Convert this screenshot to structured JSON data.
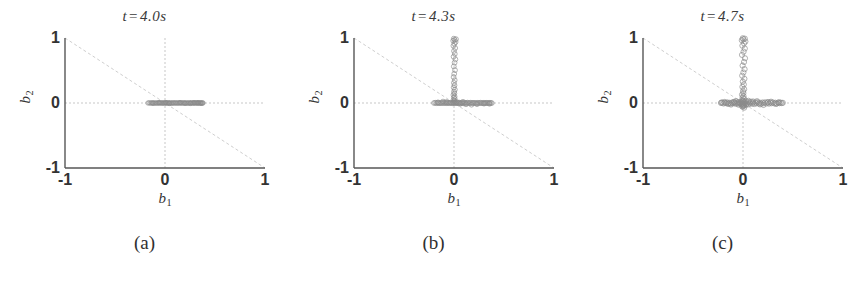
{
  "figure": {
    "background": "#ffffff",
    "axis_color": "#555555",
    "grid_color": "#aaaaaa",
    "diagonal_color": "#bbbbbb",
    "point_color": "#8a8a8a"
  },
  "panels": [
    {
      "key": "a",
      "title_var": "t",
      "title_eq": "=",
      "title_value": "4.0s",
      "title": "t = 4.0s",
      "subcaption": "(a)",
      "xlabel": "b",
      "xlabel_sub": "1",
      "ylabel": "b",
      "ylabel_sub": "2",
      "xticks": [
        "-1",
        "0",
        "1"
      ],
      "yticks": [
        "1",
        "0",
        "-1"
      ]
    },
    {
      "key": "b",
      "title_var": "t",
      "title_eq": "=",
      "title_value": "4.3s",
      "title": "t = 4.3s",
      "subcaption": "(b)",
      "xlabel": "b",
      "xlabel_sub": "1",
      "ylabel": "b",
      "ylabel_sub": "2",
      "xticks": [
        "-1",
        "0",
        "1"
      ],
      "yticks": [
        "1",
        "0",
        "-1"
      ]
    },
    {
      "key": "c",
      "title_var": "t",
      "title_eq": "=",
      "title_value": "4.7s",
      "title": "t = 4.7s",
      "subcaption": "(c)",
      "xlabel": "b",
      "xlabel_sub": "1",
      "ylabel": "b",
      "ylabel_sub": "2",
      "xticks": [
        "-1",
        "0",
        "1"
      ],
      "yticks": [
        "1",
        "0",
        "-1"
      ]
    }
  ],
  "chart_data": [
    {
      "type": "scatter",
      "title": "t = 4.0s",
      "subcaption": "(a)",
      "xlabel": "b_1",
      "ylabel": "b_2",
      "xlim": [
        -1,
        1
      ],
      "ylim": [
        -1,
        1
      ],
      "xticks": [
        -1,
        0,
        1
      ],
      "yticks": [
        -1,
        0,
        1
      ],
      "grid": "dashed crosshair at x=0 and y=0",
      "annotations": [
        {
          "type": "line",
          "name": "anti-diagonal",
          "from": [
            -1,
            1
          ],
          "to": [
            1,
            -1
          ],
          "style": "dashed",
          "color": "#bbbbbb"
        }
      ],
      "marker": "open circle",
      "marker_size": 2.2,
      "description": "Points collapse to a thin horizontal band on b_2 = 0, spanning roughly b_1 from -0.17 to 0.38.",
      "points": [
        [
          -0.17,
          0.0
        ],
        [
          -0.158,
          0.003
        ],
        [
          -0.146,
          -0.002
        ],
        [
          -0.135,
          0.001
        ],
        [
          -0.124,
          0.004
        ],
        [
          -0.113,
          -0.003
        ],
        [
          -0.102,
          0.002
        ],
        [
          -0.092,
          0.0
        ],
        [
          -0.082,
          -0.004
        ],
        [
          -0.072,
          0.003
        ],
        [
          -0.063,
          0.001
        ],
        [
          -0.054,
          -0.002
        ],
        [
          -0.045,
          0.004
        ],
        [
          -0.036,
          0.0
        ],
        [
          -0.028,
          -0.003
        ],
        [
          -0.02,
          0.002
        ],
        [
          -0.012,
          0.001
        ],
        [
          -0.005,
          -0.001
        ],
        [
          0.003,
          0.003
        ],
        [
          0.011,
          0.0
        ],
        [
          0.019,
          -0.002
        ],
        [
          0.027,
          0.004
        ],
        [
          0.035,
          0.001
        ],
        [
          0.043,
          -0.003
        ],
        [
          0.051,
          0.002
        ],
        [
          0.06,
          0.0
        ],
        [
          0.068,
          -0.004
        ],
        [
          0.077,
          0.003
        ],
        [
          0.085,
          0.001
        ],
        [
          0.094,
          -0.002
        ],
        [
          0.103,
          0.004
        ],
        [
          0.112,
          0.0
        ],
        [
          0.121,
          -0.003
        ],
        [
          0.13,
          0.002
        ],
        [
          0.139,
          0.001
        ],
        [
          0.148,
          -0.001
        ],
        [
          0.157,
          0.003
        ],
        [
          0.166,
          0.0
        ],
        [
          0.175,
          -0.002
        ],
        [
          0.184,
          0.004
        ],
        [
          0.193,
          0.001
        ],
        [
          0.202,
          -0.003
        ],
        [
          0.211,
          0.002
        ],
        [
          0.22,
          0.0
        ],
        [
          0.229,
          -0.004
        ],
        [
          0.238,
          0.003
        ],
        [
          0.247,
          0.001
        ],
        [
          0.256,
          -0.002
        ],
        [
          0.265,
          0.004
        ],
        [
          0.274,
          0.0
        ],
        [
          0.282,
          -0.003
        ],
        [
          0.29,
          0.002
        ],
        [
          0.298,
          0.001
        ],
        [
          0.306,
          -0.001
        ],
        [
          0.313,
          0.003
        ],
        [
          0.32,
          0.0
        ],
        [
          0.327,
          -0.002
        ],
        [
          0.334,
          0.002
        ],
        [
          0.341,
          0.001
        ],
        [
          0.348,
          -0.001
        ],
        [
          0.355,
          0.002
        ],
        [
          0.362,
          0.0
        ],
        [
          0.369,
          -0.002
        ],
        [
          0.375,
          0.001
        ],
        [
          0.38,
          0.0
        ],
        [
          -0.06,
          0.006
        ],
        [
          0.045,
          -0.006
        ],
        [
          0.15,
          0.006
        ],
        [
          0.255,
          -0.006
        ],
        [
          0.33,
          0.005
        ],
        [
          -0.12,
          -0.005
        ],
        [
          0.01,
          0.005
        ],
        [
          0.2,
          -0.005
        ],
        [
          0.29,
          0.006
        ],
        [
          0.36,
          -0.004
        ]
      ]
    },
    {
      "type": "scatter",
      "title": "t = 4.3s",
      "subcaption": "(b)",
      "xlabel": "b_1",
      "ylabel": "b_2",
      "xlim": [
        -1,
        1
      ],
      "ylim": [
        -1,
        1
      ],
      "xticks": [
        -1,
        0,
        1
      ],
      "yticks": [
        -1,
        0,
        1
      ],
      "grid": "dashed crosshair at x=0 and y=0",
      "annotations": [
        {
          "type": "line",
          "name": "anti-diagonal",
          "from": [
            -1,
            1
          ],
          "to": [
            1,
            -1
          ],
          "style": "dashed",
          "color": "#bbbbbb"
        }
      ],
      "marker": "open circle",
      "marker_size": 2.4,
      "description": "Horizontal band on b_2 = 0 from about -0.20 to 0.38, plus an emerging vertical spray along b_1 = 0 reaching b_2 = 1.",
      "points": [
        [
          -0.2,
          0.0
        ],
        [
          -0.188,
          0.004
        ],
        [
          -0.176,
          -0.003
        ],
        [
          -0.164,
          0.002
        ],
        [
          -0.152,
          0.0
        ],
        [
          -0.14,
          -0.004
        ],
        [
          -0.128,
          0.003
        ],
        [
          -0.116,
          0.001
        ],
        [
          -0.105,
          -0.002
        ],
        [
          -0.094,
          0.005
        ],
        [
          -0.083,
          0.0
        ],
        [
          -0.072,
          -0.003
        ],
        [
          -0.062,
          0.004
        ],
        [
          -0.052,
          0.001
        ],
        [
          -0.043,
          -0.002
        ],
        [
          -0.034,
          0.006
        ],
        [
          -0.026,
          0.002
        ],
        [
          -0.018,
          -0.004
        ],
        [
          -0.011,
          0.008
        ],
        [
          -0.005,
          0.003
        ],
        [
          0.001,
          -0.002
        ],
        [
          0.007,
          0.01
        ],
        [
          0.013,
          0.004
        ],
        [
          0.02,
          -0.003
        ],
        [
          0.027,
          0.014
        ],
        [
          0.034,
          0.002
        ],
        [
          0.042,
          -0.005
        ],
        [
          0.05,
          0.007
        ],
        [
          0.058,
          0.001
        ],
        [
          0.067,
          -0.003
        ],
        [
          0.076,
          0.004
        ],
        [
          0.085,
          0.0
        ],
        [
          0.094,
          -0.004
        ],
        [
          0.104,
          0.003
        ],
        [
          0.114,
          0.001
        ],
        [
          0.124,
          -0.002
        ],
        [
          0.134,
          0.005
        ],
        [
          0.145,
          0.0
        ],
        [
          0.156,
          -0.003
        ],
        [
          0.167,
          0.004
        ],
        [
          0.178,
          0.001
        ],
        [
          0.189,
          -0.002
        ],
        [
          0.2,
          0.003
        ],
        [
          0.211,
          0.0
        ],
        [
          0.222,
          -0.004
        ],
        [
          0.233,
          0.002
        ],
        [
          0.244,
          0.001
        ],
        [
          0.255,
          -0.002
        ],
        [
          0.266,
          0.004
        ],
        [
          0.277,
          0.0
        ],
        [
          0.288,
          -0.003
        ],
        [
          0.298,
          0.002
        ],
        [
          0.308,
          0.001
        ],
        [
          0.318,
          -0.002
        ],
        [
          0.328,
          0.003
        ],
        [
          0.338,
          0.0
        ],
        [
          0.348,
          -0.002
        ],
        [
          0.358,
          0.002
        ],
        [
          0.368,
          0.001
        ],
        [
          0.378,
          -0.001
        ],
        [
          0.005,
          0.03
        ],
        [
          -0.004,
          0.046
        ],
        [
          0.008,
          0.062
        ],
        [
          -0.002,
          0.082
        ],
        [
          0.006,
          0.1
        ],
        [
          -0.006,
          0.124
        ],
        [
          0.004,
          0.148
        ],
        [
          0.0,
          0.176
        ],
        [
          0.009,
          0.205
        ],
        [
          -0.003,
          0.238
        ],
        [
          0.005,
          0.272
        ],
        [
          -0.001,
          0.31
        ],
        [
          0.007,
          0.352
        ],
        [
          -0.004,
          0.398
        ],
        [
          0.002,
          0.448
        ],
        [
          0.01,
          0.505
        ],
        [
          -0.002,
          0.562
        ],
        [
          0.006,
          0.62
        ],
        [
          0.014,
          0.672
        ],
        [
          -0.004,
          0.712
        ],
        [
          0.008,
          0.755
        ],
        [
          0.0,
          0.8
        ],
        [
          0.012,
          0.845
        ],
        [
          -0.006,
          0.88
        ],
        [
          0.004,
          0.912
        ],
        [
          0.016,
          0.938
        ],
        [
          -0.008,
          0.958
        ],
        [
          0.006,
          0.972
        ],
        [
          0.02,
          0.982
        ],
        [
          -0.002,
          0.99
        ],
        [
          -0.11,
          0.022
        ],
        [
          -0.075,
          0.016
        ],
        [
          0.06,
          -0.014
        ],
        [
          0.12,
          -0.02
        ],
        [
          0.175,
          -0.026
        ],
        [
          0.355,
          -0.012
        ],
        [
          -0.16,
          0.01
        ],
        [
          0.23,
          -0.018
        ],
        [
          0.3,
          -0.01
        ],
        [
          0.09,
          0.018
        ]
      ]
    },
    {
      "type": "scatter",
      "title": "t = 4.7s",
      "subcaption": "(c)",
      "xlabel": "b_1",
      "ylabel": "b_2",
      "xlim": [
        -1,
        1
      ],
      "ylim": [
        -1,
        1
      ],
      "xticks": [
        -1,
        0,
        1
      ],
      "yticks": [
        -1,
        0,
        1
      ],
      "grid": "dashed crosshair at x=0 and y=0",
      "annotations": [
        {
          "type": "line",
          "name": "anti-diagonal",
          "from": [
            -1,
            1
          ],
          "to": [
            1,
            -1
          ],
          "style": "dashed",
          "color": "#bbbbbb"
        }
      ],
      "marker": "open circle",
      "marker_size": 2.6,
      "description": "Dense cross / plus-shaped cloud centered near the origin: broad horizontal band from about -0.22 to 0.40 with vertical thickness, plus a vertical spray along b_1 = 0 up to b_2 = 1.",
      "points": [
        [
          -0.22,
          0.0
        ],
        [
          -0.206,
          0.006
        ],
        [
          -0.194,
          -0.008
        ],
        [
          -0.182,
          0.004
        ],
        [
          -0.17,
          -0.003
        ],
        [
          -0.158,
          0.01
        ],
        [
          -0.146,
          -0.006
        ],
        [
          -0.135,
          0.003
        ],
        [
          -0.124,
          -0.01
        ],
        [
          -0.113,
          0.007
        ],
        [
          -0.103,
          -0.004
        ],
        [
          -0.093,
          0.012
        ],
        [
          -0.083,
          -0.007
        ],
        [
          -0.074,
          0.005
        ],
        [
          -0.065,
          -0.013
        ],
        [
          -0.056,
          0.009
        ],
        [
          -0.048,
          -0.005
        ],
        [
          -0.04,
          0.016
        ],
        [
          -0.033,
          -0.009
        ],
        [
          -0.026,
          0.007
        ],
        [
          -0.019,
          -0.018
        ],
        [
          -0.013,
          0.012
        ],
        [
          -0.008,
          -0.006
        ],
        [
          -0.003,
          0.022
        ],
        [
          0.002,
          -0.012
        ],
        [
          0.007,
          0.008
        ],
        [
          0.012,
          -0.024
        ],
        [
          0.018,
          0.016
        ],
        [
          0.024,
          -0.008
        ],
        [
          0.031,
          0.028
        ],
        [
          0.038,
          -0.015
        ],
        [
          0.046,
          0.01
        ],
        [
          0.054,
          -0.02
        ],
        [
          0.063,
          0.014
        ],
        [
          0.072,
          -0.007
        ],
        [
          0.082,
          0.018
        ],
        [
          0.092,
          -0.011
        ],
        [
          0.102,
          0.006
        ],
        [
          0.113,
          -0.016
        ],
        [
          0.124,
          0.009
        ],
        [
          0.135,
          -0.005
        ],
        [
          0.147,
          0.013
        ],
        [
          0.159,
          -0.008
        ],
        [
          0.171,
          0.004
        ],
        [
          0.183,
          -0.012
        ],
        [
          0.195,
          0.008
        ],
        [
          0.208,
          -0.004
        ],
        [
          0.221,
          0.011
        ],
        [
          0.234,
          -0.007
        ],
        [
          0.247,
          0.005
        ],
        [
          0.26,
          -0.01
        ],
        [
          0.273,
          0.007
        ],
        [
          0.286,
          -0.004
        ],
        [
          0.299,
          0.009
        ],
        [
          0.312,
          -0.006
        ],
        [
          0.325,
          0.004
        ],
        [
          0.338,
          -0.008
        ],
        [
          0.351,
          0.005
        ],
        [
          0.364,
          -0.003
        ],
        [
          0.376,
          0.006
        ],
        [
          0.388,
          -0.002
        ],
        [
          0.398,
          0.003
        ],
        [
          -0.215,
          0.008
        ],
        [
          -0.15,
          -0.014
        ],
        [
          -0.09,
          0.018
        ],
        [
          0.03,
          -0.03
        ],
        [
          0.1,
          0.024
        ],
        [
          0.17,
          -0.022
        ],
        [
          0.25,
          0.016
        ],
        [
          0.33,
          -0.014
        ],
        [
          0.0,
          0.034
        ],
        [
          -0.008,
          0.048
        ],
        [
          0.01,
          0.064
        ],
        [
          -0.004,
          0.084
        ],
        [
          0.006,
          0.104
        ],
        [
          -0.01,
          0.128
        ],
        [
          0.004,
          0.152
        ],
        [
          0.0,
          0.182
        ],
        [
          0.012,
          0.212
        ],
        [
          -0.006,
          0.248
        ],
        [
          0.008,
          0.286
        ],
        [
          -0.002,
          0.328
        ],
        [
          0.014,
          0.372
        ],
        [
          -0.008,
          0.42
        ],
        [
          0.004,
          0.47
        ],
        [
          0.016,
          0.52
        ],
        [
          -0.004,
          0.575
        ],
        [
          0.01,
          0.63
        ],
        [
          0.02,
          0.688
        ],
        [
          -0.01,
          0.74
        ],
        [
          0.006,
          0.79
        ],
        [
          0.018,
          0.838
        ],
        [
          -0.006,
          0.882
        ],
        [
          0.01,
          0.918
        ],
        [
          0.024,
          0.946
        ],
        [
          -0.012,
          0.966
        ],
        [
          0.004,
          0.98
        ],
        [
          0.018,
          0.99
        ],
        [
          -0.002,
          0.996
        ],
        [
          -0.006,
          -0.03
        ],
        [
          0.008,
          -0.044
        ],
        [
          -0.002,
          -0.058
        ],
        [
          0.012,
          -0.072
        ],
        [
          -0.01,
          -0.05
        ],
        [
          0.002,
          -0.038
        ],
        [
          -0.07,
          0.03
        ],
        [
          -0.045,
          -0.026
        ],
        [
          0.055,
          0.034
        ],
        [
          0.14,
          0.028
        ],
        [
          0.205,
          -0.03
        ],
        [
          0.28,
          0.02
        ],
        [
          -0.12,
          -0.024
        ],
        [
          -0.185,
          0.016
        ],
        [
          0.36,
          0.012
        ]
      ]
    }
  ]
}
